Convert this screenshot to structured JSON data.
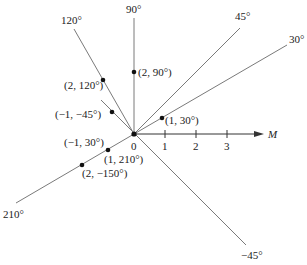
{
  "figure": {
    "type": "polar-coordinates",
    "origin_label": "0",
    "axis_label": "M",
    "ticks": [
      "1",
      "2",
      "3"
    ],
    "rays": [
      {
        "angle": 90,
        "label": "90°"
      },
      {
        "angle": 120,
        "label": "120°"
      },
      {
        "angle": 45,
        "label": "45°"
      },
      {
        "angle": 30,
        "label": "30°"
      },
      {
        "angle": 210,
        "label": "210°"
      },
      {
        "angle": -45,
        "label": "−45°"
      }
    ],
    "points": [
      {
        "label": "(2, 90°)"
      },
      {
        "label": "(2, 120°)"
      },
      {
        "label": "(−1, −45°)"
      },
      {
        "label": "(1, 30°)"
      },
      {
        "label": "(−1, 30°)"
      },
      {
        "label": "(1, 210°)"
      },
      {
        "label": "(2, −150°)"
      }
    ],
    "colors": {
      "line": "#777777",
      "ink": "#111111"
    }
  }
}
